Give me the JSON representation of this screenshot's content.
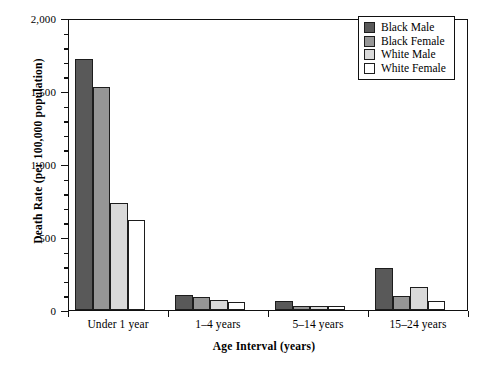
{
  "chart_data": {
    "type": "bar",
    "title": "",
    "xlabel": "Age Interval (years)",
    "ylabel": "Death Rate (per 100,000 population)",
    "categories": [
      "Under 1 year",
      "1–4 years",
      "5–14 years",
      "15–24 years"
    ],
    "series": [
      {
        "name": "Black Male",
        "color": "#595959",
        "values": [
          1720,
          100,
          60,
          290
        ]
      },
      {
        "name": "Black Female",
        "color": "#969696",
        "values": [
          1525,
          90,
          30,
          95
        ]
      },
      {
        "name": "White Male",
        "color": "#d9d9d9",
        "values": [
          730,
          70,
          28,
          160
        ]
      },
      {
        "name": "White Female",
        "color": "#ffffff",
        "values": [
          615,
          55,
          25,
          65
        ]
      }
    ],
    "ylim": [
      0,
      2000
    ],
    "ymajor_ticks": [
      0,
      500,
      1000,
      1500,
      2000
    ],
    "ytick_labels": [
      "0",
      "500",
      "1,000",
      "1,500",
      "2,000"
    ],
    "yminor_step": 100,
    "grid": false,
    "legend_position": "top-right"
  }
}
